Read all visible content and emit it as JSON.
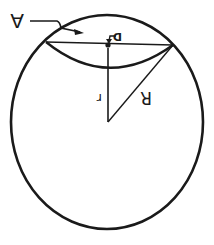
{
  "diagram": {
    "labels": {
      "area": "A",
      "point": "D",
      "distance": "r",
      "radius": "R"
    },
    "colors": {
      "ink": "#1a1a1a",
      "background": "#ffffff"
    }
  }
}
